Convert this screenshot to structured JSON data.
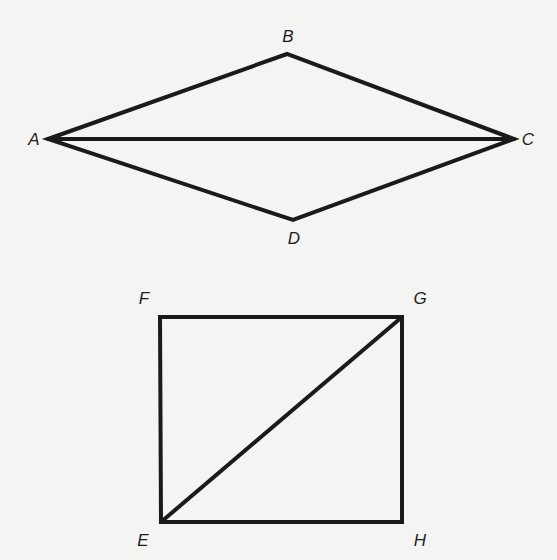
{
  "figure": {
    "background_color": "#f4f4f2",
    "stroke_color": "#1a1a1a",
    "label_color": "#1e1e1e"
  },
  "kite": {
    "name": "quadrilateral ABCD",
    "vertices": {
      "A": {
        "label": "A",
        "x": 48,
        "y": 139,
        "label_x": 34,
        "label_y": 141
      },
      "B": {
        "label": "B",
        "x": 287,
        "y": 54,
        "label_x": 288,
        "label_y": 38
      },
      "C": {
        "label": "C",
        "x": 514,
        "y": 139,
        "label_x": 528,
        "label_y": 141
      },
      "D": {
        "label": "D",
        "x": 293,
        "y": 220,
        "label_x": 294,
        "label_y": 240
      }
    },
    "edges": [
      "AB",
      "BC",
      "CD",
      "DA"
    ],
    "diagonals": [
      "AC"
    ]
  },
  "rectangle": {
    "name": "quadrilateral EFGH",
    "vertices": {
      "F": {
        "label": "F",
        "x": 160,
        "y": 317,
        "label_x": 144,
        "label_y": 300
      },
      "G": {
        "label": "G",
        "x": 402,
        "y": 317,
        "label_x": 420,
        "label_y": 300
      },
      "H": {
        "label": "H",
        "x": 402,
        "y": 522,
        "label_x": 420,
        "label_y": 542
      },
      "E": {
        "label": "E",
        "x": 161,
        "y": 522,
        "label_x": 143,
        "label_y": 542
      }
    },
    "edges": [
      "FG",
      "GH",
      "HE",
      "EF"
    ],
    "diagonals": [
      "EG"
    ]
  }
}
